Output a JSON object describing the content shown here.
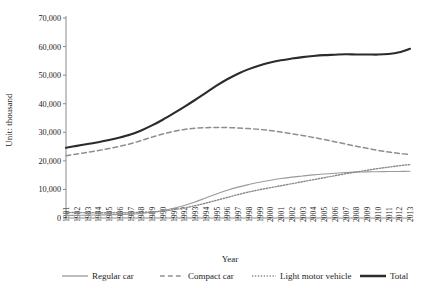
{
  "chart_data": {
    "type": "line",
    "title": "",
    "xlabel": "Year",
    "ylabel": "Unit: thousand",
    "ylim": [
      0,
      70000
    ],
    "ytick_labels": [
      "0",
      "10,000",
      "20,000",
      "30,000",
      "40,000",
      "50,000",
      "60,000",
      "70,000"
    ],
    "ytick_values": [
      0,
      10000,
      20000,
      30000,
      40000,
      50000,
      60000,
      70000
    ],
    "grid": false,
    "legend_position": "bottom",
    "categories": [
      "1981",
      "1982",
      "1983",
      "1984",
      "1985",
      "1986",
      "1987",
      "1988",
      "1989",
      "1990",
      "1991",
      "1992",
      "1993",
      "1994",
      "1995",
      "1996",
      "1997",
      "1998",
      "1999",
      "2000",
      "2001",
      "2002",
      "2003",
      "2004",
      "2005",
      "2006",
      "2007",
      "2008",
      "2009",
      "2010",
      "2011",
      "2012",
      "2013"
    ],
    "series": [
      {
        "name": "Regular car",
        "style": "solid",
        "color": "#9a9a9a",
        "width": 1.1,
        "values": [
          900,
          950,
          1000,
          1060,
          1130,
          1220,
          1350,
          1600,
          2000,
          2600,
          3400,
          4400,
          5600,
          7000,
          8400,
          9700,
          10800,
          11700,
          12500,
          13200,
          13800,
          14300,
          14700,
          15100,
          15400,
          15650,
          15900,
          16050,
          16150,
          16200,
          16250,
          16300,
          16350
        ]
      },
      {
        "name": "Compact car",
        "style": "dashed",
        "color": "#8e8e8e",
        "width": 1.5,
        "values": [
          21800,
          22400,
          23000,
          23600,
          24300,
          25100,
          26000,
          27100,
          28300,
          29400,
          30300,
          31000,
          31400,
          31600,
          31700,
          31650,
          31500,
          31300,
          31000,
          30600,
          30100,
          29500,
          28900,
          28200,
          27500,
          26700,
          25900,
          25100,
          24400,
          23700,
          23100,
          22600,
          22200
        ]
      },
      {
        "name": "Light motor vehicle",
        "style": "dotted",
        "color": "#8a8a8a",
        "width": 1.4,
        "values": [
          1900,
          1900,
          1880,
          1860,
          1850,
          1850,
          1880,
          1950,
          2100,
          2400,
          2900,
          3500,
          4300,
          5200,
          6200,
          7200,
          8200,
          9100,
          9900,
          10600,
          11300,
          12000,
          12700,
          13400,
          14100,
          14800,
          15500,
          16100,
          16700,
          17300,
          17800,
          18300,
          18700
        ]
      },
      {
        "name": "Total",
        "style": "solid",
        "color": "#2b2b2b",
        "width": 2.1,
        "values": [
          24600,
          25250,
          25880,
          26520,
          27280,
          28170,
          29230,
          30650,
          32400,
          34400,
          36600,
          38900,
          41300,
          43800,
          46300,
          48550,
          50500,
          52100,
          53400,
          54400,
          55200,
          55800,
          56300,
          56700,
          57000,
          57150,
          57300,
          57250,
          57250,
          57200,
          57400,
          58000,
          59250
        ]
      }
    ]
  },
  "legend": {
    "items": [
      {
        "label": "Regular car"
      },
      {
        "label": "Compact car"
      },
      {
        "label": "Light motor vehicle"
      },
      {
        "label": "Total"
      }
    ]
  }
}
